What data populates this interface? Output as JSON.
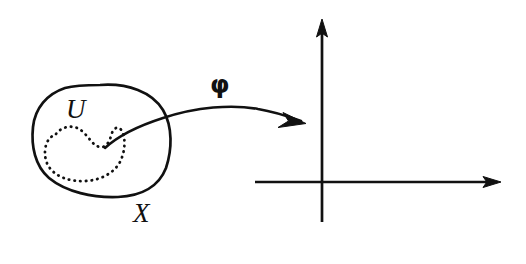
{
  "figure": {
    "kind": "mathematical-diagram",
    "width": 526,
    "height": 264,
    "background_color": "#ffffff",
    "ink_color": "#111111"
  },
  "labels": {
    "manifold": "X",
    "open_set": "U",
    "chart_map": "φ"
  },
  "shapes": {
    "manifold_blob": {
      "name": "X",
      "style": "solid-closed-curve",
      "stroke_width": 2.6
    },
    "open_subset": {
      "name": "U",
      "style": "dotted-closed-curve",
      "stroke_width": 2.6,
      "dot_pattern": "0.5 5.2"
    },
    "chart_arrow": {
      "name": "φ",
      "style": "curved-arrow",
      "stroke_width": 2.4,
      "from": "inside U",
      "to": "coordinate plane"
    }
  },
  "axes": {
    "origin_x": 322,
    "origin_y": 182,
    "vertical": {
      "name": "y-axis",
      "top": 20,
      "bottom": 222,
      "arrow_at": "top"
    },
    "horizontal": {
      "name": "x-axis",
      "left": 255,
      "right": 500,
      "arrow_at": "right"
    },
    "stroke_width": 2.6
  }
}
